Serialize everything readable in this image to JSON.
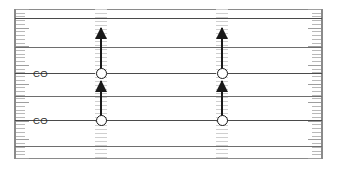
{
  "figure": {
    "width": 337,
    "height": 169,
    "background_color": "#ffffff"
  },
  "frame": {
    "name": "plot-border",
    "color": "#8a8a8a",
    "left_x": 14,
    "right_x": 321,
    "top_y": 9,
    "bottom_y": 158
  },
  "axis": {
    "name": "tick-rail",
    "tick_color": "#b9b9b9",
    "major_tick_color": "#9e9e9e",
    "tick_count": 40,
    "sides": [
      "left",
      "right"
    ]
  },
  "levels": [
    {
      "id": "level-1",
      "y": 18,
      "style": "dark",
      "color": "#4a4a4a"
    },
    {
      "id": "level-2",
      "y": 47,
      "style": "light",
      "color": "#6e6e6e"
    },
    {
      "id": "level-3",
      "y": 73,
      "style": "dark",
      "color": "#4a4a4a"
    },
    {
      "id": "level-4",
      "y": 96,
      "style": "light",
      "color": "#6e6e6e"
    },
    {
      "id": "level-5",
      "y": 120,
      "style": "dark",
      "color": "#4a4a4a"
    },
    {
      "id": "level-6",
      "y": 146,
      "style": "light",
      "color": "#6e6e6e"
    }
  ],
  "labels": [
    {
      "id": "label-co-upper",
      "text": "CO",
      "x": 33,
      "y": 68
    },
    {
      "id": "label-co-lower",
      "text": "CO",
      "x": 33,
      "y": 115
    }
  ],
  "columns": [
    {
      "id": "column-left",
      "x": 101,
      "states": [
        {
          "id": "state-left-upper",
          "y": 73,
          "shape": "circle",
          "fill": "#ffffff",
          "stroke": "#1a1a1a"
        },
        {
          "id": "state-left-lower",
          "y": 120,
          "shape": "circle",
          "fill": "#ffffff",
          "stroke": "#1a1a1a"
        }
      ],
      "arrows": [
        {
          "id": "arrow-left-upper",
          "from_y": 73,
          "to_y": 28,
          "direction": "up",
          "color": "#1a1a1a"
        },
        {
          "id": "arrow-left-lower",
          "from_y": 120,
          "to_y": 81,
          "direction": "up",
          "color": "#1a1a1a"
        }
      ]
    },
    {
      "id": "column-right",
      "x": 222,
      "states": [
        {
          "id": "state-right-upper",
          "y": 73,
          "shape": "circle",
          "fill": "#ffffff",
          "stroke": "#1a1a1a"
        },
        {
          "id": "state-right-lower",
          "y": 120,
          "shape": "circle",
          "fill": "#ffffff",
          "stroke": "#1a1a1a"
        }
      ],
      "arrows": [
        {
          "id": "arrow-right-upper",
          "from_y": 73,
          "to_y": 28,
          "direction": "up",
          "color": "#1a1a1a"
        },
        {
          "id": "arrow-right-lower",
          "from_y": 120,
          "to_y": 81,
          "direction": "up",
          "color": "#1a1a1a"
        }
      ]
    }
  ]
}
